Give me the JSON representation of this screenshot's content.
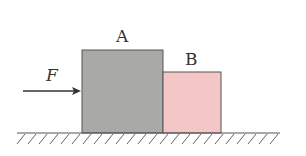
{
  "labels": {
    "block_a": "A",
    "block_b": "B",
    "force": "F"
  },
  "colors": {
    "block_a_fill": "#a9aaa7",
    "block_b_fill": "#f5c6c6",
    "stroke": "#555555",
    "background": "#ffffff"
  }
}
